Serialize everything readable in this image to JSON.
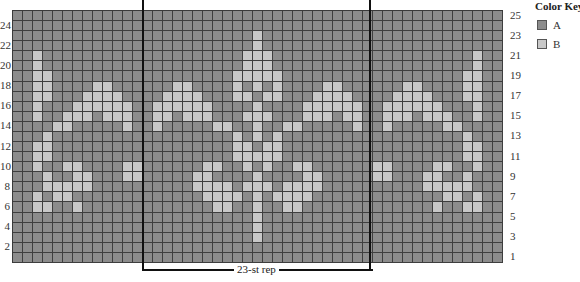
{
  "chart_data": {
    "type": "heatmap",
    "columns": 49,
    "rows": 25,
    "repeat": {
      "label": "23-st rep",
      "start_col": 13,
      "end_col": 35,
      "stitches": 23
    },
    "row_numbers_left": [
      24,
      22,
      20,
      18,
      16,
      14,
      12,
      10,
      8,
      6,
      4,
      2
    ],
    "row_numbers_right": [
      25,
      23,
      21,
      19,
      17,
      15,
      13,
      11,
      9,
      7,
      5,
      3,
      1
    ],
    "colors": {
      "A": "#8c8c8c",
      "B": "#c8c8c8"
    },
    "light_cells_B_by_row": {
      "25": [],
      "24": [],
      "23": [
        24
      ],
      "22": [
        24
      ],
      "21": [
        2,
        23,
        24,
        25,
        46
      ],
      "20": [
        2,
        23,
        24,
        25,
        46
      ],
      "19": [
        2,
        3,
        22,
        23,
        24,
        25,
        26,
        45,
        46
      ],
      "18": [
        2,
        3,
        8,
        9,
        16,
        17,
        22,
        24,
        26,
        31,
        32,
        39,
        40,
        45,
        46
      ],
      "17": [
        2,
        3,
        7,
        8,
        9,
        10,
        15,
        16,
        17,
        18,
        22,
        23,
        25,
        26,
        30,
        31,
        32,
        33,
        38,
        39,
        40,
        41,
        45,
        46
      ],
      "16": [
        2,
        6,
        7,
        8,
        9,
        10,
        11,
        14,
        15,
        16,
        17,
        18,
        19,
        24,
        29,
        30,
        31,
        32,
        33,
        34,
        37,
        38,
        39,
        40,
        41,
        42,
        46
      ],
      "15": [
        2,
        5,
        6,
        7,
        9,
        10,
        11,
        14,
        15,
        17,
        18,
        19,
        23,
        24,
        25,
        29,
        30,
        31,
        33,
        34,
        37,
        38,
        39,
        41,
        42,
        43,
        46
      ],
      "14": [
        4,
        5,
        11,
        14,
        20,
        21,
        24,
        27,
        28,
        34,
        37,
        43,
        44
      ],
      "13": [
        3,
        22,
        24,
        26,
        45
      ],
      "12": [
        2,
        3,
        22,
        23,
        25,
        26,
        45,
        46
      ],
      "11": [
        2,
        3,
        22,
        23,
        24,
        25,
        26,
        45,
        46
      ],
      "10": [
        2,
        5,
        6,
        11,
        12,
        19,
        20,
        23,
        25,
        28,
        29,
        36,
        37,
        42,
        43,
        46
      ],
      "9": [
        3,
        6,
        7,
        11,
        12,
        18,
        19,
        24,
        29,
        30,
        36,
        37,
        41,
        42,
        45
      ],
      "8": [
        3,
        4,
        5,
        6,
        7,
        18,
        19,
        20,
        21,
        23,
        24,
        25,
        27,
        28,
        29,
        30,
        41,
        42,
        43,
        44,
        45
      ],
      "7": [
        2,
        4,
        5,
        19,
        20,
        21,
        22,
        24,
        26,
        27,
        28,
        29,
        43,
        44,
        46
      ],
      "6": [
        2,
        3,
        6,
        20,
        21,
        24,
        27,
        28,
        42,
        45,
        46
      ],
      "5": [
        24
      ],
      "4": [
        24
      ],
      "3": [
        24
      ],
      "2": [],
      "1": []
    },
    "legend": [
      {
        "key": "A",
        "label": "A",
        "color": "#8c8c8c"
      },
      {
        "key": "B",
        "label": "B",
        "color": "#c8c8c8"
      }
    ],
    "legend_title": "Color Key",
    "grid": true
  },
  "key": {
    "title": "Color Key",
    "items": [
      {
        "label": "A",
        "color": "#8c8c8c"
      },
      {
        "label": "B",
        "color": "#c8c8c8"
      }
    ]
  },
  "repeat_label": "23-st rep"
}
